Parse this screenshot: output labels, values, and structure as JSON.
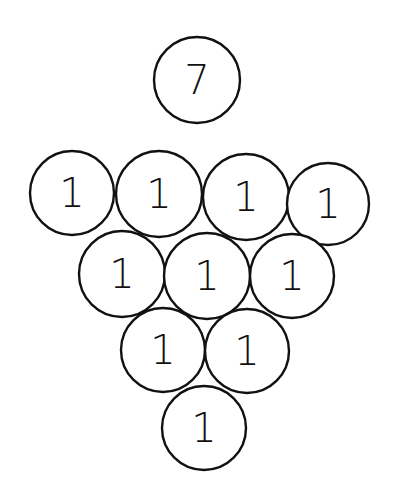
{
  "diagram": {
    "stroke_color": "#111111",
    "background": "#ffffff",
    "top_ball": {
      "label": "7",
      "cx": 197,
      "cy": 80,
      "r": 43
    },
    "rows": [
      [
        {
          "label": "1",
          "cx": 72,
          "cy": 193,
          "r": 42
        },
        {
          "label": "1",
          "cx": 159,
          "cy": 194,
          "r": 43
        },
        {
          "label": "1",
          "cx": 246,
          "cy": 197,
          "r": 43
        },
        {
          "label": "1",
          "cx": 328,
          "cy": 204,
          "r": 41
        }
      ],
      [
        {
          "label": "1",
          "cx": 122,
          "cy": 274,
          "r": 43
        },
        {
          "label": "1",
          "cx": 207,
          "cy": 276,
          "r": 43
        },
        {
          "label": "1",
          "cx": 292,
          "cy": 276,
          "r": 42
        }
      ],
      [
        {
          "label": "1",
          "cx": 163,
          "cy": 350,
          "r": 42
        },
        {
          "label": "1",
          "cx": 247,
          "cy": 351,
          "r": 42
        }
      ],
      [
        {
          "label": "1",
          "cx": 204,
          "cy": 428,
          "r": 42
        }
      ]
    ]
  }
}
